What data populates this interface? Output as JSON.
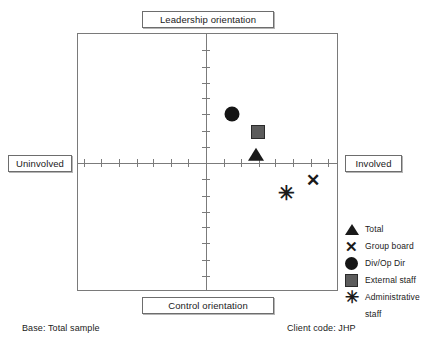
{
  "captions": {
    "top": "Leadership orientation",
    "bottom": "Control orientation",
    "left": "Uninvolved",
    "right": "Involved"
  },
  "footer": {
    "base": "Base: Total sample",
    "client": "Client code:  JHP"
  },
  "legend": {
    "items": [
      {
        "label": "Total",
        "symbol": "triangle-marker"
      },
      {
        "label": "Group board",
        "symbol": "cross-marker"
      },
      {
        "label": "Div/Op Dir",
        "symbol": "circle-marker"
      },
      {
        "label": "External staff",
        "symbol": "square-marker"
      },
      {
        "label": "Administrative",
        "symbol": "asterisk-marker"
      }
    ],
    "wrap_line": "staff"
  },
  "colors": {
    "frame": "#7a7a7a",
    "axis": "#7a7a7a",
    "marker_dark": "#1a1a1a",
    "marker_gray": "#5c5c5c",
    "caption_border": "#6d6d6d",
    "background": "#ffffff"
  },
  "chart_data": {
    "type": "scatter",
    "title": "",
    "xlabel": "Involved / Uninvolved",
    "ylabel": "Leadership orientation / Control orientation",
    "axis_captions": {
      "top": "Leadership orientation",
      "bottom": "Control orientation",
      "left": "Uninvolved",
      "right": "Involved"
    },
    "xlim": [
      -7.5,
      7.5
    ],
    "ylim": [
      -8.0,
      8.0
    ],
    "x_ticks_per_side": 7,
    "y_ticks_per_side": 7,
    "tick_labels": [],
    "grid": false,
    "axes_cross_at": [
      0,
      0
    ],
    "legend_position": "right-bottom",
    "series": [
      {
        "name": "Total",
        "symbol": "triangle",
        "color": "#1a1a1a",
        "x": 2.8,
        "y": 0.7
      },
      {
        "name": "Group board",
        "symbol": "cross",
        "color": "#1a1a1a",
        "x": 6.0,
        "y": -1.0
      },
      {
        "name": "Div/Op Dir",
        "symbol": "circle",
        "color": "#151515",
        "x": 1.4,
        "y": 3.1
      },
      {
        "name": "External staff",
        "symbol": "square",
        "color": "#5c5c5c",
        "x": 2.9,
        "y": 2.0
      },
      {
        "name": "Administrative staff",
        "symbol": "asterisk",
        "color": "#1a1a1a",
        "x": 4.5,
        "y": -1.8
      }
    ]
  }
}
